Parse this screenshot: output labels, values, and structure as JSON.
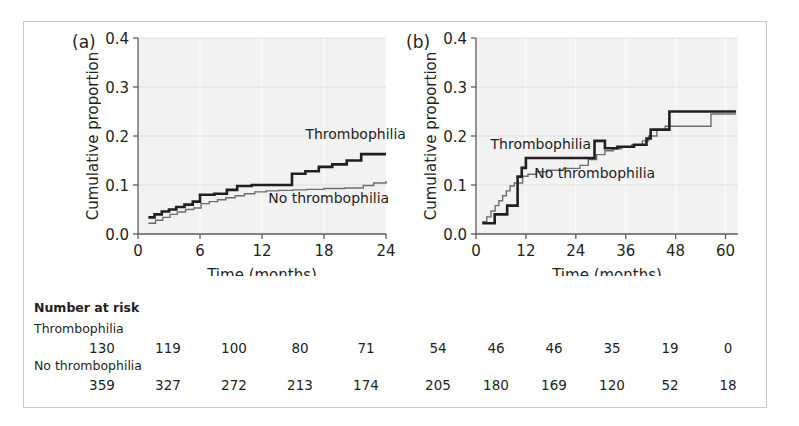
{
  "figure": {
    "panels": [
      {
        "tag": "(a)"
      },
      {
        "tag": "(b)"
      }
    ]
  },
  "risk_table": {
    "title": "Number at risk",
    "groups": [
      {
        "label": "Thrombophilia",
        "panel_a_values": [
          "130",
          "119",
          "100",
          "80",
          "71"
        ],
        "panel_b_values": [
          "54",
          "46",
          "46",
          "35",
          "19",
          "0"
        ]
      },
      {
        "label": "No thrombophilia",
        "panel_a_values": [
          "359",
          "327",
          "272",
          "213",
          "174"
        ],
        "panel_b_values": [
          "205",
          "180",
          "169",
          "120",
          "52",
          "18"
        ]
      }
    ]
  },
  "chart_data": [
    {
      "type": "line",
      "panel": "a",
      "title": "(a)",
      "xlabel": "Time (months)",
      "ylabel": "Cumulative proportion",
      "xlim": [
        0,
        24
      ],
      "ylim": [
        0,
        0.4
      ],
      "xticks": [
        0,
        6,
        12,
        18,
        24
      ],
      "xticklabels": [
        "0",
        "6",
        "12",
        "18",
        "24"
      ],
      "yticks": [
        0.0,
        0.1,
        0.2,
        0.3,
        0.4
      ],
      "yticklabels": [
        "0.0",
        "0.1",
        "0.2",
        "0.3",
        "0.4"
      ],
      "grid": true,
      "legend_position": "inline-annotations",
      "annotations": [
        {
          "text": "Thrombophilia",
          "x": 16.2,
          "y": 0.193
        },
        {
          "text": "No thrombophilia",
          "x": 12.6,
          "y": 0.063
        }
      ],
      "series": [
        {
          "name": "Thrombophilia",
          "style": "thick",
          "step": "post",
          "x": [
            1.0,
            1.6,
            2.3,
            3.0,
            3.7,
            4.5,
            5.3,
            6.0,
            7.4,
            8.6,
            9.6,
            11.0,
            14.0,
            14.9,
            16.2,
            17.5,
            18.8,
            20.2,
            21.6,
            24.0
          ],
          "y": [
            0.034,
            0.04,
            0.046,
            0.05,
            0.055,
            0.06,
            0.066,
            0.08,
            0.082,
            0.09,
            0.098,
            0.1,
            0.1,
            0.123,
            0.128,
            0.137,
            0.142,
            0.15,
            0.163,
            0.163
          ]
        },
        {
          "name": "No thrombophilia",
          "style": "thin",
          "step": "post",
          "x": [
            1.0,
            1.7,
            2.4,
            3.1,
            3.8,
            4.6,
            5.4,
            6.1,
            6.9,
            7.7,
            8.5,
            9.4,
            10.3,
            11.3,
            12.4,
            13.6,
            15.0,
            16.3,
            18.0,
            20.0,
            21.8,
            22.8,
            24.0
          ],
          "y": [
            0.022,
            0.028,
            0.034,
            0.04,
            0.045,
            0.05,
            0.053,
            0.062,
            0.066,
            0.07,
            0.074,
            0.078,
            0.082,
            0.086,
            0.088,
            0.089,
            0.09,
            0.091,
            0.093,
            0.094,
            0.099,
            0.104,
            0.108
          ]
        }
      ]
    },
    {
      "type": "line",
      "panel": "b",
      "title": "(b)",
      "xlabel": "Time (months)",
      "ylabel": "Cumulative proportion",
      "xlim": [
        0,
        63
      ],
      "ylim": [
        0,
        0.4
      ],
      "xticks": [
        0,
        12,
        24,
        36,
        48,
        60
      ],
      "xticklabels": [
        "0",
        "12",
        "24",
        "36",
        "48",
        "60"
      ],
      "yticks": [
        0.0,
        0.1,
        0.2,
        0.3,
        0.4
      ],
      "yticklabels": [
        "0.0",
        "0.1",
        "0.2",
        "0.3",
        "0.4"
      ],
      "grid": true,
      "legend_position": "inline-annotations",
      "annotations": [
        {
          "text": "Thrombophilia",
          "x": 3.5,
          "y": 0.174
        },
        {
          "text": "No thrombophilia",
          "x": 14.0,
          "y": 0.115
        }
      ],
      "series": [
        {
          "name": "Thrombophilia",
          "style": "thick",
          "step": "post",
          "x": [
            1.5,
            2.5,
            4.5,
            6.0,
            7.5,
            9.0,
            10.0,
            11.0,
            12.0,
            26.5,
            28.5,
            31.0,
            34.0,
            38.0,
            41.0,
            42.0,
            46.5,
            60.5,
            62.5
          ],
          "y": [
            0.022,
            0.022,
            0.04,
            0.04,
            0.058,
            0.058,
            0.117,
            0.135,
            0.155,
            0.155,
            0.19,
            0.175,
            0.178,
            0.182,
            0.195,
            0.213,
            0.25,
            0.25,
            0.25
          ]
        },
        {
          "name": "No thrombophilia",
          "style": "thin",
          "step": "post",
          "x": [
            1.5,
            2.6,
            3.6,
            4.6,
            5.5,
            6.4,
            7.3,
            8.2,
            9.2,
            10.2,
            11.2,
            12.5,
            14.5,
            17.0,
            21.0,
            25.0,
            27.0,
            29.0,
            31.0,
            33.0,
            35.0,
            37.5,
            40.0,
            41.5,
            43.5,
            45.5,
            56.5,
            62.5
          ],
          "y": [
            0.025,
            0.035,
            0.047,
            0.058,
            0.068,
            0.078,
            0.088,
            0.098,
            0.104,
            0.104,
            0.118,
            0.122,
            0.127,
            0.13,
            0.134,
            0.14,
            0.152,
            0.162,
            0.17,
            0.174,
            0.178,
            0.182,
            0.19,
            0.2,
            0.212,
            0.22,
            0.245,
            0.245
          ]
        }
      ]
    }
  ]
}
